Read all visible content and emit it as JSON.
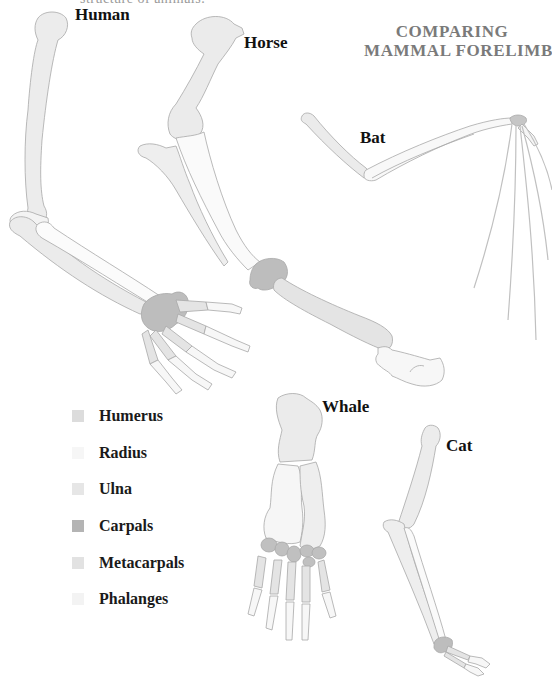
{
  "header": {
    "cropped_top_text": "structure of animals.",
    "title_line1": "COMPARING",
    "title_line2": "MAMMAL  FORELIMBS"
  },
  "animals": [
    {
      "name": "Human",
      "label_x": 75,
      "label_y": 5
    },
    {
      "name": "Horse",
      "label_x": 244,
      "label_y": 33
    },
    {
      "name": "Bat",
      "label_x": 360,
      "label_y": 128
    },
    {
      "name": "Whale",
      "label_x": 322,
      "label_y": 397
    },
    {
      "name": "Cat",
      "label_x": 446,
      "label_y": 436
    }
  ],
  "legend": [
    {
      "label": "Humerus",
      "color": "#dcdcdc"
    },
    {
      "label": "Radius",
      "color": "#f6f6f6"
    },
    {
      "label": "Ulna",
      "color": "#e6e6e6"
    },
    {
      "label": "Carpals",
      "color": "#b4b4b4"
    },
    {
      "label": "Metacarpals",
      "color": "#e2e2e2"
    },
    {
      "label": "Phalanges",
      "color": "#f3f3f3"
    }
  ],
  "colors": {
    "title": "#7a7a7a",
    "outline": "#a8a8a8",
    "humerus": "#ebebeb",
    "radius": "#fafafa",
    "ulna": "#eeeeee",
    "carpals": "#bdbdbd",
    "metacarpals": "#e4e4e4",
    "phalanges": "#f7f7f7"
  }
}
